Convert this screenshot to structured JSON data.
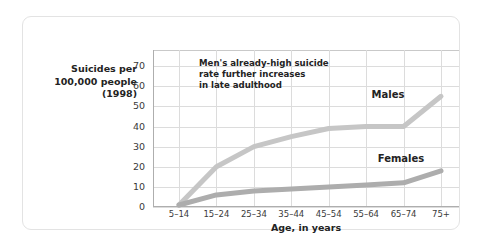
{
  "chart_data": {
    "type": "line",
    "title": "",
    "xlabel": "Age, in years",
    "ylabel": "Suicides per 100,000 people (1998)",
    "ylabel_lines": [
      "Suicides per",
      "100,000 people",
      "(1998)"
    ],
    "categories": [
      "5–14",
      "15–24",
      "25–34",
      "35–44",
      "45–54",
      "55–64",
      "65–74",
      "75+"
    ],
    "yticks": [
      0,
      10,
      20,
      30,
      40,
      50,
      60,
      70
    ],
    "ylim": [
      0,
      78
    ],
    "grid": true,
    "legend": "inline-labels",
    "series": [
      {
        "name": "Males",
        "color": "#c6c6c6",
        "values": [
          1,
          20,
          30,
          35,
          39,
          40,
          40,
          55
        ]
      },
      {
        "name": "Females",
        "color": "#adadad",
        "values": [
          1,
          6,
          8,
          9,
          10,
          11,
          12,
          18
        ]
      }
    ],
    "annotations": [
      {
        "name": "males-late-adulthood-note",
        "lines": [
          "Men's already-high suicide",
          "rate further increases",
          "in late adulthood"
        ]
      }
    ]
  },
  "colors": {
    "males_line": "#c6c6c6",
    "females_line": "#adadad",
    "grid": "#dcdcdc",
    "axis": "#aeaeae",
    "frame": "#e3e3e3",
    "text": "#232323",
    "background": "#ffffff"
  }
}
